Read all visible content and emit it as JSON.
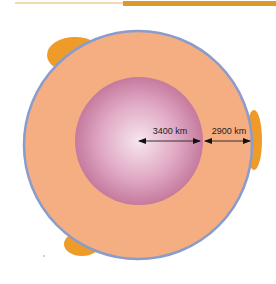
{
  "diagram": {
    "labels": {
      "core_radius": "3400 km",
      "mantle_thickness": "2900 km"
    },
    "colors": {
      "header_rule": "#e0a030",
      "mantle": "#f5ad82",
      "core_center": "#f4e2ea",
      "core_edge": "#c97ba0",
      "outline": "#8a9ccc",
      "blobs": "#ef9b2a"
    }
  }
}
